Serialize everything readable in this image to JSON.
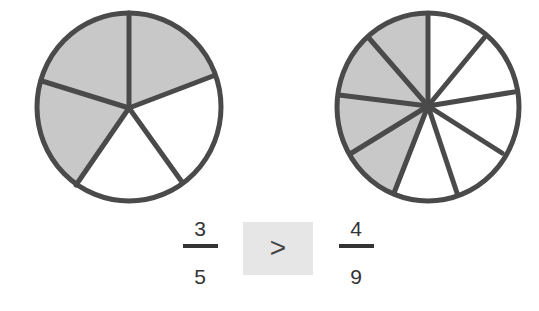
{
  "colors": {
    "shaded": "#c8c8c8",
    "unshaded": "#ffffff",
    "stroke": "#4a4a4a",
    "box": "#e6e6e6"
  },
  "left_pie": {
    "parts": 5,
    "shaded": 3
  },
  "right_pie": {
    "parts": 9,
    "shaded": 4
  },
  "fraction_left": {
    "numerator": "3",
    "denominator": "5"
  },
  "fraction_right": {
    "numerator": "4",
    "denominator": "9"
  },
  "comparison": {
    "symbol": ">"
  }
}
